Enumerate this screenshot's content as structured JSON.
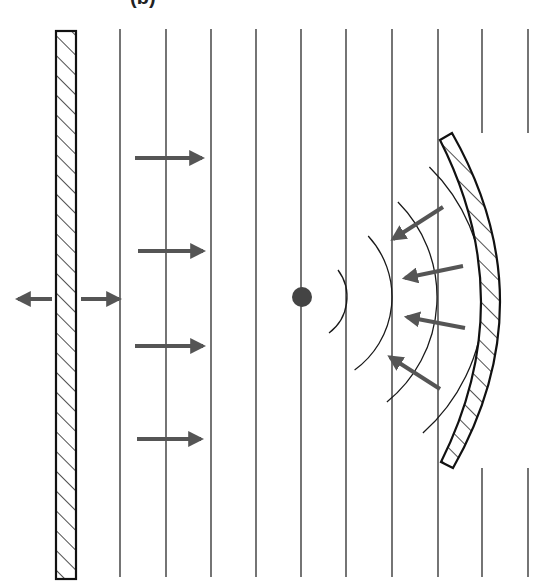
{
  "figure": {
    "label": "(b)",
    "colors": {
      "line": "#2a2a2a",
      "arrow": "#555555",
      "plate_outline": "#111111",
      "focus_dot": "#444444",
      "background": "#ffffff"
    }
  },
  "flat_plate": {
    "x": 56,
    "y": 31,
    "width": 20,
    "height": 548,
    "pattern": "hatched"
  },
  "plane_wavefronts": {
    "x_positions": [
      120,
      166,
      211,
      256,
      301,
      346,
      392,
      438,
      482,
      528
    ],
    "y_top": 29,
    "y_bottom": 577,
    "gap_lines": [
      482,
      528
    ],
    "gap_top_end": 133,
    "gap_bottom_start": 468
  },
  "emission_arrows": [
    {
      "direction": "left",
      "x1": 52,
      "y1": 299,
      "x2": 18,
      "y2": 299
    },
    {
      "direction": "right",
      "x1": 81,
      "y1": 299,
      "x2": 119,
      "y2": 299
    }
  ],
  "incident_arrows": [
    {
      "x1": 135,
      "y1": 158,
      "x2": 202,
      "y2": 158
    },
    {
      "x1": 138,
      "y1": 251,
      "x2": 203,
      "y2": 251
    },
    {
      "x1": 135,
      "y1": 346,
      "x2": 203,
      "y2": 346
    },
    {
      "x1": 137,
      "y1": 439,
      "x2": 201,
      "y2": 439
    }
  ],
  "concave_mirror": {
    "top": [
      446,
      136
    ],
    "bottom": [
      447,
      466
    ],
    "apex_x": 490,
    "pattern": "hatched"
  },
  "focus_point": {
    "cx": 302,
    "cy": 297,
    "r": 10
  },
  "converging_arcs": [
    {
      "radius": 45,
      "y_top": 270,
      "y_bottom": 333
    },
    {
      "radius": 90,
      "y_top": 236,
      "y_bottom": 370
    },
    {
      "radius": 135,
      "y_top": 202,
      "y_bottom": 402
    },
    {
      "radius": 182,
      "y_top": 167,
      "y_bottom": 433
    }
  ],
  "reflected_arrows": [
    {
      "x1": 443,
      "y1": 207,
      "x2": 393,
      "y2": 239
    },
    {
      "x1": 463,
      "y1": 266,
      "x2": 405,
      "y2": 278
    },
    {
      "x1": 465,
      "y1": 328,
      "x2": 407,
      "y2": 317
    },
    {
      "x1": 440,
      "y1": 389,
      "x2": 390,
      "y2": 357
    }
  ]
}
